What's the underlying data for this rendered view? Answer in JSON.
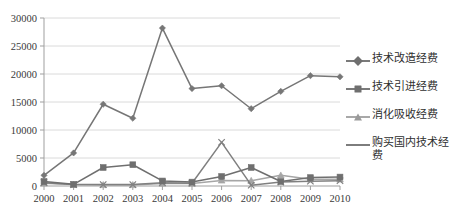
{
  "chart_data": {
    "type": "line",
    "title": "",
    "xlabel": "",
    "ylabel": "",
    "ylim": [
      0,
      30000
    ],
    "ytick_step": 5000,
    "grid": true,
    "legend_position": "right",
    "categories": [
      "2000",
      "2001",
      "2002",
      "2003",
      "2004",
      "2005",
      "2006",
      "2007",
      "2008",
      "2009",
      "2010"
    ],
    "yticks": [
      "0",
      "5000",
      "10000",
      "15000",
      "20000",
      "25000",
      "30000"
    ],
    "series": [
      {
        "name": "技术改造经费",
        "marker": "diamond",
        "color": "#767676",
        "values": [
          1900,
          5900,
          14600,
          12100,
          28200,
          17400,
          17900,
          13800,
          16900,
          19700,
          19500
        ]
      },
      {
        "name": "技术引进经费",
        "marker": "square",
        "color": "#6f6f6f",
        "values": [
          800,
          300,
          3300,
          3800,
          900,
          700,
          1700,
          3300,
          800,
          1500,
          1600
        ]
      },
      {
        "name": "消化吸收经费",
        "marker": "triangle",
        "color": "#a6a6a6",
        "values": [
          500,
          250,
          200,
          200,
          450,
          450,
          1000,
          950,
          1900,
          1200,
          1200
        ]
      },
      {
        "name": "购买国内技术经费",
        "marker": "none",
        "color": "#808080",
        "values": [
          600,
          250,
          250,
          250,
          600,
          500,
          7800,
          150,
          700,
          850,
          950
        ]
      }
    ]
  },
  "legend": {
    "items": [
      {
        "label": "技术改造经费",
        "marker": "diamond-marker"
      },
      {
        "label": "技术引进经费",
        "marker": "square-marker"
      },
      {
        "label": "消化吸收经费",
        "marker": "triangle-marker"
      },
      {
        "label": "购买国内技术经费",
        "marker": "line-marker"
      }
    ]
  }
}
